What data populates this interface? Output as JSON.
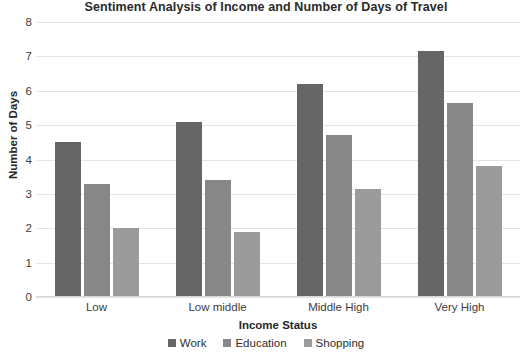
{
  "chart_data": {
    "type": "bar",
    "title": "Sentiment Analysis of Income and Number of Days of Travel",
    "xlabel": "Income Status",
    "ylabel": "Number of Days",
    "categories": [
      "Low",
      "Low middle",
      "Middle High",
      "Very High"
    ],
    "series": [
      {
        "name": "Work",
        "color": "#666666",
        "values": [
          4.5,
          5.1,
          6.2,
          7.15
        ]
      },
      {
        "name": "Education",
        "color": "#878787",
        "values": [
          3.3,
          3.4,
          4.7,
          5.65
        ]
      },
      {
        "name": "Shopping",
        "color": "#9b9b9b",
        "values": [
          2.0,
          1.9,
          3.15,
          3.8
        ]
      }
    ],
    "ylim": [
      0,
      8
    ],
    "yticks": [
      0,
      1,
      2,
      3,
      4,
      5,
      6,
      7,
      8
    ],
    "ytick_labels": [
      "0",
      "1",
      "2",
      "3",
      "4",
      "5",
      "6",
      "7",
      "8"
    ],
    "grid": true,
    "legend_position": "bottom"
  }
}
